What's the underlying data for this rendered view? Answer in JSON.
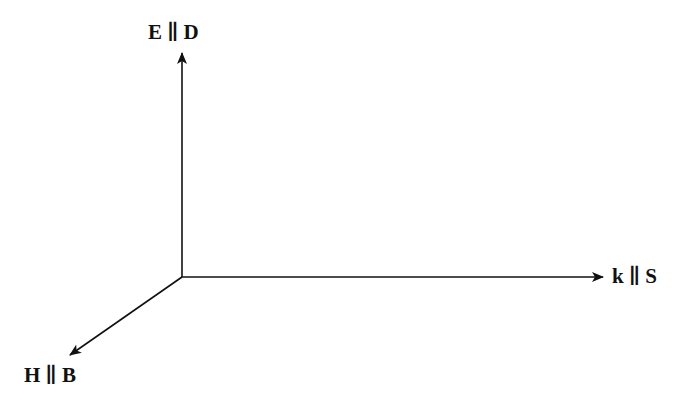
{
  "diagram": {
    "title": "",
    "axes": [
      {
        "id": "vertical",
        "label": "E ∥ D",
        "direction": "up"
      },
      {
        "id": "horizontal",
        "label": "k ∥ S",
        "direction": "right"
      },
      {
        "id": "diagonal",
        "label": "H ∥ B",
        "direction": "down-left"
      }
    ],
    "colors": {
      "stroke": "#111111",
      "background": "#ffffff"
    }
  }
}
